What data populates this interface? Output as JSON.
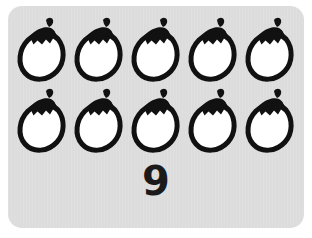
{
  "card": {
    "background_color": "#dcdcdc",
    "page_background_color": "#ffffff"
  },
  "icons": {
    "name": "eggplant-icon",
    "label": "eggplant",
    "body_fill": "#ffffff",
    "outline_color": "#111111",
    "stem_color": "#111111",
    "total_count": 10,
    "rows": [
      {
        "row_index": 1,
        "items": [
          "eggplant",
          "eggplant",
          "eggplant",
          "eggplant",
          "eggplant"
        ]
      },
      {
        "row_index": 2,
        "items": [
          "eggplant",
          "eggplant",
          "eggplant",
          "eggplant",
          "eggplant"
        ]
      }
    ]
  },
  "count_label": {
    "value": "9",
    "color": "#1a1a1a"
  }
}
